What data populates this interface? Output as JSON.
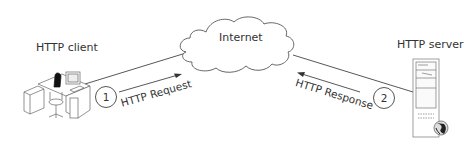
{
  "nodes": {
    "client": {
      "label": "HTTP client",
      "icon": "workstation-icon"
    },
    "internet": {
      "label": "Internet",
      "icon": "cloud-icon"
    },
    "server": {
      "label": "HTTP server",
      "icon": "server-tower-icon"
    }
  },
  "flows": [
    {
      "step": "1",
      "label": "HTTP Request",
      "direction": "client-to-internet"
    },
    {
      "step": "2",
      "label": "HTTP Response",
      "direction": "server-to-internet"
    }
  ]
}
